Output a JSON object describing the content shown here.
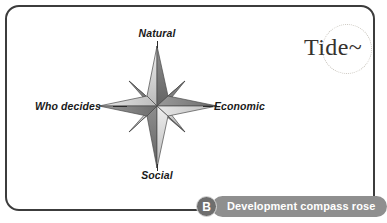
{
  "figure": {
    "background_color": "#ffffff",
    "border_color": "#3c3c3c"
  },
  "diagram": {
    "name": "development-compass-rose",
    "type": "compass-rose",
    "center": {
      "x": 157,
      "y": 106
    },
    "points": 8,
    "axes": [
      {
        "direction": "north",
        "label": "Natural"
      },
      {
        "direction": "east",
        "label": "Economic"
      },
      {
        "direction": "south",
        "label": "Social"
      },
      {
        "direction": "west",
        "label": "Who decides"
      }
    ],
    "label_north": "Natural",
    "label_east": "Economic",
    "label_south": "Social",
    "label_west": "Who decides",
    "colors": {
      "point_light": "#d8d8d8",
      "point_mid": "#a9a9a9",
      "point_dark": "#7d7d7d",
      "outline": "#4a4a4a"
    }
  },
  "logo": {
    "text": "Tide~",
    "ring_color": "#c8c4bc",
    "text_color": "#35312e"
  },
  "caption": {
    "badge_letter": "B",
    "text": "Development compass rose",
    "bar_color": "#8f8f8f",
    "badge_color": "#6e6e6e",
    "text_color": "#ffffff"
  }
}
